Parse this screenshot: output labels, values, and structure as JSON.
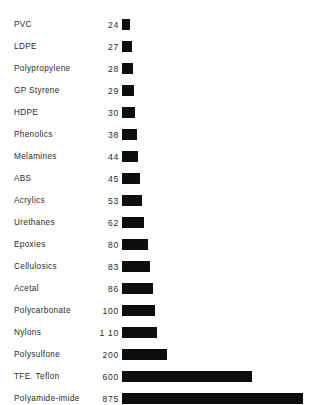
{
  "chart_data": {
    "type": "bar",
    "title": "",
    "subtitle": "",
    "xlabel": "",
    "ylabel": "",
    "orientation": "horizontal",
    "grid": false,
    "legend": null,
    "axis_note": "Value labels printed beside each category; bar lengths use a compressed (non-linear) scale so that small values remain visible next to 875.",
    "categories": [
      "PVC",
      "LDPE",
      "Polypropylene",
      "GP Styrene",
      "HDPE",
      "Phenolics",
      "Melamines",
      "ABS",
      "Acrylics",
      "Urethanes",
      "Epoxies",
      "Cellulosics",
      "Acetal",
      "Polycarbonate",
      "Nylons",
      "Polysulfone",
      "TFE. Teflon",
      "Polyamide-imide"
    ],
    "values": [
      24,
      27,
      28,
      29,
      30,
      38,
      44,
      45,
      53,
      62,
      80,
      83,
      86,
      100,
      110,
      200,
      600,
      875
    ],
    "value_labels": [
      "24",
      "27",
      "28",
      "29",
      "30",
      "38",
      "44",
      "45",
      "53",
      "62",
      "80",
      "83",
      "86",
      "100",
      "1 10",
      "200",
      "600",
      "875"
    ],
    "bar_pixel_widths": [
      8,
      10,
      11,
      12,
      13,
      15,
      16,
      18,
      20,
      22,
      26,
      28,
      31,
      33,
      35,
      45,
      130,
      181
    ],
    "xlim": [
      0,
      875
    ],
    "bar_color": "#0d0d0d",
    "background_color": "#ffffff"
  },
  "rows": [
    {
      "label": "PVC",
      "value": "24",
      "width": 8
    },
    {
      "label": "LDPE",
      "value": "27",
      "width": 10
    },
    {
      "label": "Polypropylene",
      "value": "28",
      "width": 11
    },
    {
      "label": "GP Styrene",
      "value": "29",
      "width": 12
    },
    {
      "label": "HDPE",
      "value": "30",
      "width": 13
    },
    {
      "label": "Phenolics",
      "value": "38",
      "width": 15
    },
    {
      "label": "Melamines",
      "value": "44",
      "width": 16
    },
    {
      "label": "ABS",
      "value": "45",
      "width": 18
    },
    {
      "label": "Acrylics",
      "value": "53",
      "width": 20
    },
    {
      "label": "Urethanes",
      "value": "62",
      "width": 22
    },
    {
      "label": "Epoxies",
      "value": "80",
      "width": 26
    },
    {
      "label": "Cellulosics",
      "value": "83",
      "width": 28
    },
    {
      "label": "Acetal",
      "value": "86",
      "width": 31
    },
    {
      "label": "Polycarbonate",
      "value": "100",
      "width": 33
    },
    {
      "label": "Nylons",
      "value": "1 10",
      "width": 35
    },
    {
      "label": "Polysulfone",
      "value": "200",
      "width": 45
    },
    {
      "label": "TFE. Teflon",
      "value": "600",
      "width": 130
    },
    {
      "label": "Polyamide-imide",
      "value": "875",
      "width": 181
    }
  ]
}
